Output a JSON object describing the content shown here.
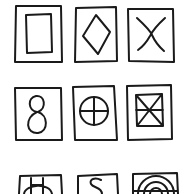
{
  "figure": {
    "description": "Hand-drawn grid of 9 square frames, each containing a symbol",
    "stroke_color": "#1a1a1a",
    "background": "#ffffff",
    "rows": 3,
    "cols": 3
  },
  "cells": [
    {
      "row": 1,
      "col": 1,
      "symbol": "inner-rectangle",
      "label": "Rectangle inside square"
    },
    {
      "row": 1,
      "col": 2,
      "symbol": "diamond",
      "label": "Diamond"
    },
    {
      "row": 1,
      "col": 3,
      "symbol": "x-cross",
      "label": "X"
    },
    {
      "row": 2,
      "col": 1,
      "symbol": "figure-eight",
      "label": "8"
    },
    {
      "row": 2,
      "col": 2,
      "symbol": "circle-cross",
      "label": "Circle with cross"
    },
    {
      "row": 2,
      "col": 3,
      "symbol": "boxed-x-with-midline",
      "label": "Square with X and midline"
    },
    {
      "row": 3,
      "col": 1,
      "symbol": "circle-with-h",
      "label": "Circle with H"
    },
    {
      "row": 3,
      "col": 2,
      "symbol": "s-curve",
      "label": "S"
    },
    {
      "row": 3,
      "col": 3,
      "symbol": "concentric-arcs",
      "label": "Concentric arcs"
    }
  ]
}
